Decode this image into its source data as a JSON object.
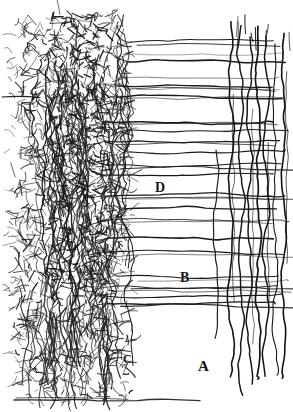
{
  "figure": {
    "kind": "histological-ink-drawing",
    "width": 293,
    "height": 412,
    "background_color": "#ffffff",
    "ink_color": "#1a1a1a",
    "ink_color_light": "#4a4a4a"
  },
  "labels": [
    {
      "id": "A",
      "text": "A",
      "x": 205,
      "y": 368,
      "meaning": "vertical-fiber-bundle"
    },
    {
      "id": "B",
      "text": "B",
      "x": 186,
      "y": 280,
      "meaning": "lower-horizontal-tract"
    },
    {
      "id": "C",
      "text": "C",
      "x": 128,
      "y": 362,
      "meaning": "descending-plexus-fibers"
    },
    {
      "id": "D",
      "text": "D",
      "x": 161,
      "y": 190,
      "meaning": "middle-horizontal-tract"
    }
  ],
  "regions": {
    "plexus": {
      "name": "dendritic-plexus",
      "x_start": 18,
      "x_end": 125,
      "y_start": 12,
      "y_end": 400,
      "description": "Dense tangled meshwork of fine branching neurites"
    },
    "horizontal_tracts": {
      "name": "horizontal-fiber-tracts",
      "x_start": 100,
      "x_end": 290,
      "description": "Long near-horizontal axon bundles fanning rightward from the plexus",
      "rows_y": [
        42,
        62,
        86,
        97,
        122,
        130,
        141,
        152,
        165,
        175,
        196,
        209,
        220,
        238,
        252,
        276,
        286,
        296,
        304
      ]
    },
    "vertical_bundle": {
      "name": "vertical-fiber-bundle",
      "x_start": 228,
      "x_end": 288,
      "y_start": 20,
      "y_end": 396,
      "fiber_count": 7,
      "fibers_x": [
        231,
        241,
        250,
        258,
        266,
        275,
        284
      ]
    },
    "descending_fibers": {
      "name": "descending-wavy-fibers",
      "x_start": 22,
      "x_end": 128,
      "y_start": 300,
      "y_end": 404,
      "count": 16
    }
  },
  "axes": {
    "baseline_y": 400,
    "left_margin_line": {
      "y": 97,
      "x_start": 2,
      "x_end": 40
    }
  }
}
